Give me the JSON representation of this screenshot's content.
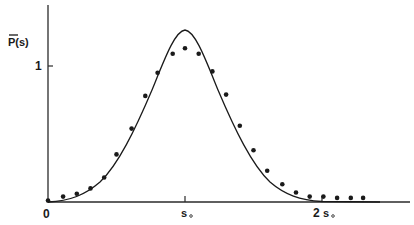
{
  "chart_data": {
    "type": "line",
    "title": "",
    "xlabel": "",
    "ylabel": "P̄(s)",
    "x_ticks": [
      {
        "value": 0,
        "label": "0"
      },
      {
        "value": 1,
        "label": "s₀"
      },
      {
        "value": 2,
        "label": "2s₀"
      }
    ],
    "y_ticks": [
      {
        "value": 1,
        "label": "1"
      }
    ],
    "xlim": [
      0,
      2.6
    ],
    "ylim": [
      0,
      1.45
    ],
    "grid": false,
    "legend": null,
    "series": [
      {
        "name": "theory curve",
        "style": "solid line",
        "color": "#1a1a1a",
        "peak": {
          "x": 1.0,
          "y": 1.26
        },
        "x": [
          0,
          0.1,
          0.2,
          0.3,
          0.4,
          0.5,
          0.6,
          0.7,
          0.8,
          0.9,
          1.0,
          1.1,
          1.2,
          1.3,
          1.4,
          1.5,
          1.6,
          1.7,
          1.8,
          1.9,
          2.0,
          2.1,
          2.2,
          2.3
        ],
        "values": [
          0.0,
          0.01,
          0.04,
          0.1,
          0.2,
          0.35,
          0.54,
          0.77,
          0.99,
          1.17,
          1.26,
          1.17,
          0.99,
          0.77,
          0.54,
          0.35,
          0.2,
          0.1,
          0.04,
          0.015,
          0.005,
          0.0,
          0.0,
          0.0
        ]
      },
      {
        "name": "data points",
        "style": "filled dots",
        "color": "#1a1a1a",
        "x": [
          0.0,
          0.11,
          0.21,
          0.31,
          0.41,
          0.5,
          0.61,
          0.71,
          0.8,
          0.91,
          1.0,
          1.1,
          1.2,
          1.3,
          1.4,
          1.5,
          1.6,
          1.71,
          1.81,
          1.91,
          2.01,
          2.11,
          2.21,
          2.3
        ],
        "values": [
          0.01,
          0.04,
          0.06,
          0.1,
          0.18,
          0.35,
          0.54,
          0.78,
          0.95,
          1.09,
          1.13,
          1.09,
          0.96,
          0.79,
          0.56,
          0.38,
          0.23,
          0.13,
          0.07,
          0.04,
          0.04,
          0.03,
          0.03,
          0.03
        ]
      }
    ]
  },
  "labels": {
    "y_axis": "P(s)",
    "y_tick_1": "1",
    "x_tick_0": "0",
    "x_tick_s0": "s",
    "x_tick_2s0_num": "2",
    "x_tick_2s0": "s"
  }
}
